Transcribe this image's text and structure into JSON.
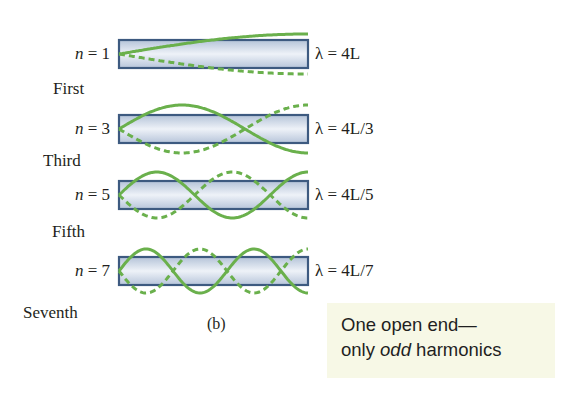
{
  "figure": {
    "caption": "(b)",
    "tube": {
      "x_left": 119,
      "x_right": 308,
      "half_height": 14,
      "fill_top": "#b4c3d8",
      "fill_mid": "#eef2f8",
      "fill_bottom": "#b7c5da",
      "border": "#3d5a80"
    },
    "wave_color": "#6ab04c",
    "harmonics": [
      {
        "n_label": "n = 1",
        "n_var": "n",
        "n_value": "1",
        "ordinal": "First",
        "lambda_label": "λ = 4L",
        "n": 1,
        "center_y": 54,
        "amplitude": 20
      },
      {
        "n_label": "n = 3",
        "n_var": "n",
        "n_value": "3",
        "ordinal": "Third",
        "lambda_label": "λ = 4L/3",
        "n": 3,
        "center_y": 129,
        "amplitude": 24
      },
      {
        "n_label": "n = 5",
        "n_var": "n",
        "n_value": "5",
        "ordinal": "Fifth",
        "lambda_label": "λ = 4L/5",
        "n": 5,
        "center_y": 195,
        "amplitude": 23
      },
      {
        "n_label": "n = 7",
        "n_var": "n",
        "n_value": "7",
        "ordinal": "Seventh",
        "lambda_label": "λ = 4L/7",
        "n": 7,
        "center_y": 271,
        "amplitude": 22
      }
    ]
  },
  "callout": {
    "line1": "One open end—",
    "line2_prefix": "only ",
    "line2_emph": "odd",
    "line2_suffix": " harmonics"
  }
}
